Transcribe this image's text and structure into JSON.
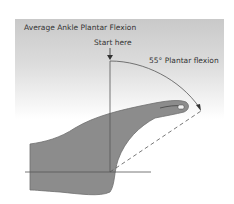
{
  "diagram": {
    "title": "Average Ankle Plantar Flexion",
    "start_label": "Start here",
    "angle_label": "55° Plantar flexion",
    "angle_degrees": 55,
    "colors": {
      "foot_fill": "#8c8c8c",
      "foot_outline": "#6e6e6e",
      "lines": "#555555",
      "text": "#333333",
      "panel_top": "#c9c9c9"
    }
  }
}
